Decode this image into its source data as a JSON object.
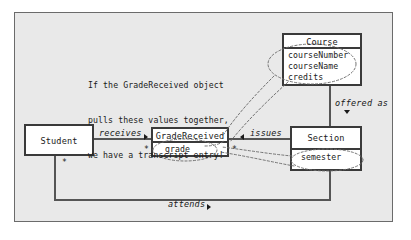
{
  "diagram": {
    "type": "uml-class-diagram",
    "background_color": "#e9e9e9",
    "frame_border_color": "#6b6b6b",
    "line_color": "#555555",
    "callout_color": "#707070",
    "note": {
      "line1": "If the GradeReceived object",
      "line2": "pulls these values together,",
      "line3": "we have a transcript entry!"
    },
    "classes": [
      {
        "id": "student",
        "name": "Student",
        "attributes": []
      },
      {
        "id": "gradereceived",
        "name": "GradeReceived",
        "attributes": [
          "grade"
        ]
      },
      {
        "id": "section",
        "name": "Section",
        "attributes": [
          "semester"
        ]
      },
      {
        "id": "course",
        "name": "Course",
        "attributes": [
          "courseNumber",
          "courseName",
          "credits"
        ]
      }
    ],
    "associations": [
      {
        "id": "receives",
        "label": "receives",
        "direction": "right",
        "from": "Student",
        "to": "GradeReceived"
      },
      {
        "id": "issues",
        "label": "issues",
        "direction": "left",
        "from": "Section",
        "to": "GradeReceived"
      },
      {
        "id": "attends",
        "label": "attends",
        "direction": "right",
        "from": "Student",
        "to": "Section"
      },
      {
        "id": "offered-as",
        "label": "offered as",
        "direction": "down",
        "from": "Course",
        "to": "Section"
      }
    ],
    "multiplicities": [
      {
        "id": "student-attends",
        "value": "*"
      },
      {
        "id": "gradereceived-left",
        "value": "*"
      },
      {
        "id": "gradereceived-right",
        "value": "*"
      }
    ],
    "highlighted_attributes": [
      "courseNumber",
      "courseName",
      "credits",
      "grade",
      "semester"
    ]
  }
}
